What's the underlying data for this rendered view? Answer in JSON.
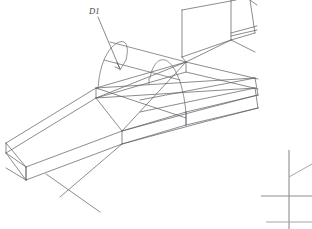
{
  "drawing": {
    "title": "Isometric wireframe solid model",
    "background_color": "#ffffff",
    "line_color": "#5a5a60",
    "light_line_color": "#84848c",
    "label_color": "#44444a",
    "axis_color": "#8d8d95"
  },
  "annotations": [
    {
      "id": "d1",
      "label": "D1",
      "label_x": 89,
      "label_y": 13,
      "leader_from_x": 97,
      "leader_from_y": 16,
      "leader_to_x": 120,
      "leader_to_y": 69,
      "arrow_x": 120,
      "arrow_y": 69
    }
  ],
  "geometry": {
    "body_outline": "M 6,143 L 96,88 L 186,62 L 255,78 L 255,88 L 186,72 L 96,98 L 6,153 Z",
    "axis_indicator": {
      "vertical_x": 289,
      "vertical_top": 150,
      "vertical_bottom": 229,
      "horizontal_y": 196,
      "horizontal_left": 261,
      "horizontal_right": 312,
      "diagonal_from_x": 289,
      "diagonal_from_y": 177,
      "diagonal_to_x": 312,
      "diagonal_to_y": 164
    }
  },
  "icons": {
    "axis_indicator": "coordinate-axis-icon",
    "dimension_leader": "dimension-leader-icon"
  }
}
